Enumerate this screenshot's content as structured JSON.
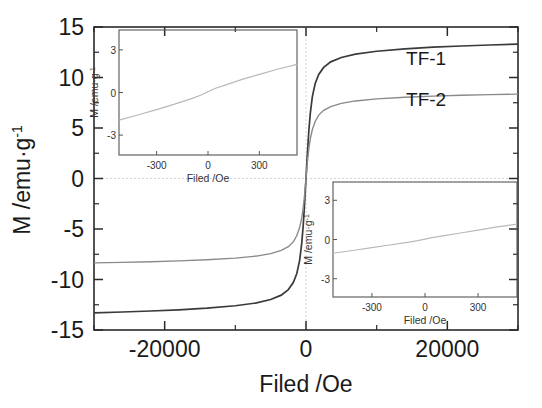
{
  "chart_data": {
    "type": "line",
    "title": "",
    "xlabel": "Filed /Oe",
    "ylabel": "M /emu·g⁻¹",
    "xlim": [
      -30000,
      30000
    ],
    "ylim": [
      -15,
      15
    ],
    "xticks": [
      -20000,
      0,
      20000
    ],
    "xticklabels": [
      "-20000",
      "0",
      "20000"
    ],
    "xminorticks": [
      -30000,
      -10000,
      10000,
      30000
    ],
    "yticks": [
      15,
      10,
      5,
      0,
      -5,
      -10,
      -15
    ],
    "yticklabels": [
      "15",
      "10",
      "5",
      "0",
      "-5",
      "-10",
      "-15"
    ],
    "yminorticks": [
      12.5,
      7.5,
      2.5,
      -2.5,
      -7.5,
      -12.5
    ],
    "grid": false,
    "legend_position": "inline-annotation",
    "series": [
      {
        "name": "TF-1",
        "color": "#3a3a3a",
        "saturation_positive": 13.2,
        "saturation_negative": -13.3,
        "points": [
          [
            -30000,
            -13.3
          ],
          [
            -26000,
            -13.22
          ],
          [
            -22000,
            -13.12
          ],
          [
            -18000,
            -13.0
          ],
          [
            -14000,
            -12.84
          ],
          [
            -10000,
            -12.6
          ],
          [
            -7000,
            -12.32
          ],
          [
            -5000,
            -11.98
          ],
          [
            -3500,
            -11.55
          ],
          [
            -2500,
            -11.0
          ],
          [
            -1800,
            -10.3
          ],
          [
            -1300,
            -9.4
          ],
          [
            -900,
            -8.1
          ],
          [
            -600,
            -6.4
          ],
          [
            -400,
            -4.7
          ],
          [
            -250,
            -3.1
          ],
          [
            -150,
            -1.9
          ],
          [
            -80,
            -1.0
          ],
          [
            -30,
            -0.38
          ],
          [
            0,
            0.0
          ],
          [
            30,
            0.38
          ],
          [
            80,
            1.0
          ],
          [
            150,
            1.9
          ],
          [
            250,
            3.1
          ],
          [
            400,
            4.7
          ],
          [
            600,
            6.4
          ],
          [
            900,
            8.1
          ],
          [
            1300,
            9.4
          ],
          [
            1800,
            10.3
          ],
          [
            2500,
            11.0
          ],
          [
            3500,
            11.55
          ],
          [
            5000,
            11.98
          ],
          [
            7000,
            12.32
          ],
          [
            10000,
            12.6
          ],
          [
            14000,
            12.84
          ],
          [
            18000,
            13.0
          ],
          [
            22000,
            13.12
          ],
          [
            26000,
            13.22
          ],
          [
            30000,
            13.3
          ]
        ]
      },
      {
        "name": "TF-2",
        "color": "#8a8a8a",
        "saturation_positive": 8.3,
        "saturation_negative": -8.35,
        "points": [
          [
            -30000,
            -8.35
          ],
          [
            -26000,
            -8.3
          ],
          [
            -22000,
            -8.24
          ],
          [
            -18000,
            -8.16
          ],
          [
            -14000,
            -8.05
          ],
          [
            -10000,
            -7.88
          ],
          [
            -7000,
            -7.68
          ],
          [
            -5000,
            -7.44
          ],
          [
            -3500,
            -7.12
          ],
          [
            -2500,
            -6.75
          ],
          [
            -1800,
            -6.28
          ],
          [
            -1300,
            -5.65
          ],
          [
            -900,
            -4.85
          ],
          [
            -600,
            -3.9
          ],
          [
            -400,
            -2.92
          ],
          [
            -250,
            -1.98
          ],
          [
            -150,
            -1.25
          ],
          [
            -80,
            -0.68
          ],
          [
            -30,
            -0.26
          ],
          [
            0,
            0.0
          ],
          [
            30,
            0.26
          ],
          [
            80,
            0.68
          ],
          [
            150,
            1.25
          ],
          [
            250,
            1.98
          ],
          [
            400,
            2.92
          ],
          [
            600,
            3.9
          ],
          [
            900,
            4.85
          ],
          [
            1300,
            5.65
          ],
          [
            1800,
            6.28
          ],
          [
            2500,
            6.75
          ],
          [
            3500,
            7.12
          ],
          [
            5000,
            7.44
          ],
          [
            7000,
            7.68
          ],
          [
            10000,
            7.88
          ],
          [
            14000,
            8.05
          ],
          [
            18000,
            8.16
          ],
          [
            22000,
            8.24
          ],
          [
            26000,
            8.3
          ],
          [
            30000,
            8.35
          ]
        ]
      }
    ],
    "annotations": [
      {
        "text": "TF-1",
        "x": 17000,
        "y": 11.2
      },
      {
        "text": "TF-2",
        "x": 17000,
        "y": 7.2
      }
    ],
    "insets": [
      {
        "name": "inset-top-left",
        "xlabel": "Filed /Oe",
        "ylabel": "M /emu·g⁻¹",
        "xlim": [
          -520,
          520
        ],
        "ylim": [
          -4.4,
          4.4
        ],
        "xticks": [
          -300,
          0,
          300
        ],
        "xticklabels": [
          "-300",
          "0",
          "300"
        ],
        "yticks": [
          3,
          0,
          -3
        ],
        "yticklabels": [
          "3",
          "0",
          "-3"
        ],
        "series": [
          {
            "name": "TF-1 low-field",
            "color": "#b9b9b9",
            "points": [
              [
                -520,
                -1.95
              ],
              [
                -400,
                -1.55
              ],
              [
                -300,
                -1.2
              ],
              [
                -200,
                -0.84
              ],
              [
                -100,
                -0.45
              ],
              [
                -40,
                -0.18
              ],
              [
                0,
                0.05
              ],
              [
                40,
                0.28
              ],
              [
                100,
                0.52
              ],
              [
                200,
                0.92
              ],
              [
                300,
                1.28
              ],
              [
                400,
                1.62
              ],
              [
                520,
                1.98
              ]
            ]
          }
        ]
      },
      {
        "name": "inset-bottom-right",
        "xlabel": "Filed /Oe",
        "ylabel": "M /emu·g⁻¹",
        "xlim": [
          -520,
          520
        ],
        "ylim": [
          -4.4,
          4.4
        ],
        "xticks": [
          -300,
          0,
          300
        ],
        "xticklabels": [
          "-300",
          "0",
          "300"
        ],
        "yticks": [
          3,
          0,
          -3
        ],
        "yticklabels": [
          "3",
          "0",
          "-3"
        ],
        "series": [
          {
            "name": "TF-2 low-field",
            "color": "#c2c2c2",
            "points": [
              [
                -520,
                -1.05
              ],
              [
                -400,
                -0.82
              ],
              [
                -300,
                -0.62
              ],
              [
                -200,
                -0.42
              ],
              [
                -100,
                -0.22
              ],
              [
                -40,
                -0.08
              ],
              [
                0,
                0.03
              ],
              [
                40,
                0.15
              ],
              [
                100,
                0.28
              ],
              [
                200,
                0.5
              ],
              [
                300,
                0.72
              ],
              [
                400,
                0.95
              ],
              [
                520,
                1.18
              ]
            ]
          }
        ]
      }
    ]
  },
  "colors": {
    "axis": "#2a2a2a",
    "series1": "#3a3a3a",
    "series2": "#8a8a8a",
    "inset_curve": "#b9b9b9",
    "background": "#ffffff"
  }
}
